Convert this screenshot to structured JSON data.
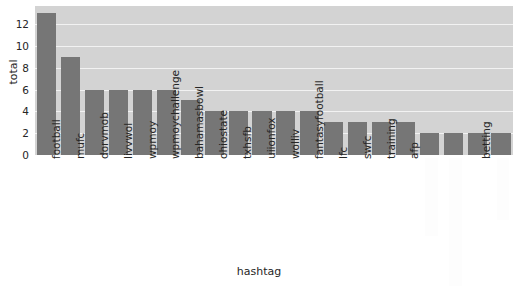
{
  "chart_data": {
    "type": "bar",
    "title": "",
    "xlabel": "hashtag",
    "ylabel": "total",
    "categories": [
      "football",
      "mufc",
      "dorvmob",
      "livvwol",
      "wpmoy",
      "wpmoychallenge",
      "bahamasbowl",
      "ohiostate",
      "txhsfb",
      "uiionfox",
      "wolliv",
      "fantasyfootball",
      "lfc",
      "swfc",
      "training",
      "afp",
      "",
      "",
      "betting",
      ""
    ],
    "values": [
      13,
      9,
      6,
      6,
      6,
      6,
      5,
      4,
      4,
      4,
      4,
      4,
      3,
      3,
      3,
      3,
      2,
      2,
      2,
      2
    ],
    "ylim": [
      0,
      13.65
    ],
    "yticks": [
      0,
      2,
      4,
      6,
      8,
      10,
      12
    ],
    "ytick_labels": [
      "0",
      "2",
      "4",
      "6",
      "8",
      "10",
      "12"
    ],
    "grid": true,
    "legend": null,
    "bar_color": "#767676",
    "axes_facecolor": "#d3d3d3",
    "gridline_color": "#f2f2f2",
    "figure_facecolor": "#ffffff",
    "redacted_tick_indices": [
      16,
      17,
      19
    ],
    "note_visible_tick_labels": [
      "football",
      "mufc",
      "dorvmob",
      "livvwol",
      "wpmoy",
      "wpmoychallenge",
      "bahamasbowl",
      "ohiostate",
      "txhsfb",
      "uiionfox",
      "wolliv",
      "fantasyfootball",
      "lfc",
      "swfc",
      "training",
      "afp",
      "betting"
    ]
  },
  "axis": {
    "ylabel_text": "total",
    "xlabel_text": "hashtag"
  }
}
